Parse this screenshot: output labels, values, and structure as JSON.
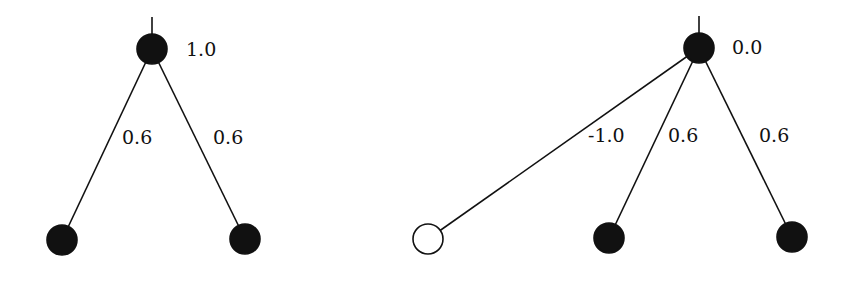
{
  "diagram": {
    "trees": [
      {
        "root": {
          "x": 152,
          "y": 49,
          "fill": "#111111",
          "label": "1.0",
          "label_x": 186,
          "label_y": 40
        },
        "stem_top": 17,
        "children": [
          {
            "x": 62,
            "y": 240,
            "fill": "#111111",
            "weight": "0.6",
            "label_x": 122,
            "label_y": 128
          },
          {
            "x": 245,
            "y": 239,
            "fill": "#111111",
            "weight": "0.6",
            "label_x": 213,
            "label_y": 128
          }
        ]
      },
      {
        "root": {
          "x": 699,
          "y": 48,
          "fill": "#111111",
          "label": "0.0",
          "label_x": 732,
          "label_y": 38
        },
        "stem_top": 16,
        "children": [
          {
            "x": 428,
            "y": 239,
            "fill": "#ffffff",
            "weight": "-1.0",
            "label_x": 588,
            "label_y": 126
          },
          {
            "x": 609,
            "y": 238,
            "fill": "#111111",
            "weight": "0.6",
            "label_x": 668,
            "label_y": 126
          },
          {
            "x": 792,
            "y": 237,
            "fill": "#111111",
            "weight": "0.6",
            "label_x": 759,
            "label_y": 126
          }
        ]
      }
    ],
    "node_radius": 15,
    "edge_color": "#111111"
  }
}
